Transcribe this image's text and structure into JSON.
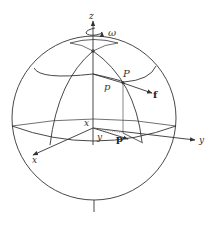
{
  "figure": {
    "type": "rotating sphere with local coordinate frame",
    "labels": {
      "z_axis": "z",
      "omega": "ω",
      "point_P": "P",
      "latitude_p": "p",
      "force_f": "f",
      "origin_x": "x",
      "origin_y": "y",
      "vector_p": "p",
      "x_axis": "x",
      "y_axis": "y"
    },
    "colors": {
      "line": "#333333",
      "background": "#ffffff",
      "dotted": "#888888"
    }
  }
}
